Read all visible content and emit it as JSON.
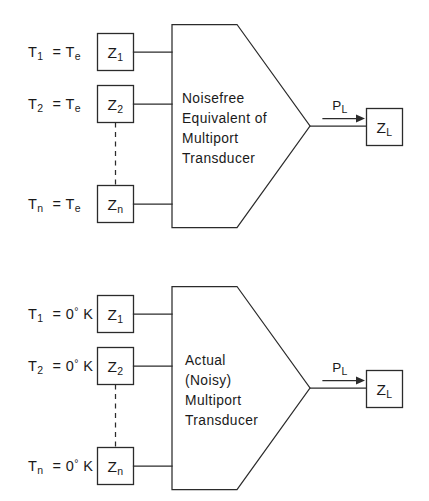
{
  "figure": {
    "type": "block-diagram",
    "line_color": "#2b2b2b",
    "background_color": "#ffffff"
  },
  "diagrams": [
    {
      "id": "noisefree-equivalent",
      "block_label_lines": [
        "Noisefree",
        "Equivalent of",
        "Multiport",
        "Transducer"
      ],
      "ports": [
        {
          "temperature_label": "T",
          "temperature_sub": "1",
          "equals": "=",
          "value": "T",
          "value_sub": "e",
          "impedance": "Z",
          "impedance_sub": "1"
        },
        {
          "temperature_label": "T",
          "temperature_sub": "2",
          "equals": "=",
          "value": "T",
          "value_sub": "e",
          "impedance": "Z",
          "impedance_sub": "2"
        },
        {
          "temperature_label": "T",
          "temperature_sub": "n",
          "equals": "=",
          "value": "T",
          "value_sub": "e",
          "impedance": "Z",
          "impedance_sub": "n"
        }
      ],
      "output": {
        "power_label": "P",
        "power_sub": "L",
        "load_label": "Z",
        "load_sub": "L"
      }
    },
    {
      "id": "actual-noisy",
      "block_label_lines": [
        "Actual",
        "(Noisy)",
        "Multiport",
        "Transducer"
      ],
      "ports": [
        {
          "temperature_label": "T",
          "temperature_sub": "1",
          "equals": "=",
          "value": "0",
          "degree": "°",
          "unit": "K",
          "impedance": "Z",
          "impedance_sub": "1"
        },
        {
          "temperature_label": "T",
          "temperature_sub": "2",
          "equals": "=",
          "value": "0",
          "degree": "°",
          "unit": "K",
          "impedance": "Z",
          "impedance_sub": "2"
        },
        {
          "temperature_label": "T",
          "temperature_sub": "n",
          "equals": "=",
          "value": "0",
          "degree": "°",
          "unit": "K",
          "impedance": "Z",
          "impedance_sub": "n"
        }
      ],
      "output": {
        "power_label": "P",
        "power_sub": "L",
        "load_label": "Z",
        "load_sub": "L"
      }
    }
  ]
}
